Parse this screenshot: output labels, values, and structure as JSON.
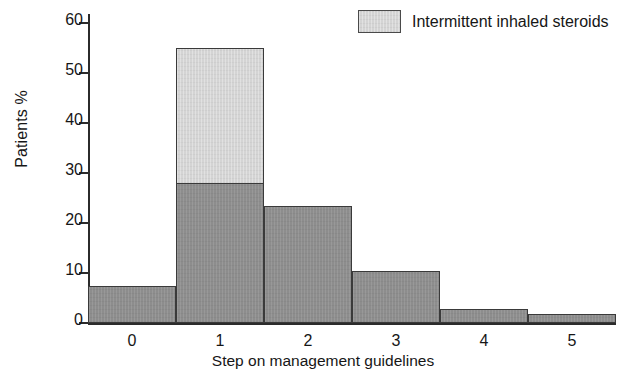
{
  "chart_data": {
    "type": "bar",
    "title": "",
    "subtitle": "",
    "xlabel": "Step on management guidelines",
    "ylabel": "Patients %",
    "categories": [
      "0",
      "1",
      "2",
      "3",
      "4",
      "5"
    ],
    "ylim": [
      0,
      60
    ],
    "xlim": [
      -0.5,
      5.5
    ],
    "yticks": [
      0,
      10,
      20,
      30,
      40,
      50,
      60
    ],
    "ytick_labels": [
      "0",
      "10",
      "20",
      "30",
      "40",
      "50",
      "60"
    ],
    "grid": false,
    "stacked": true,
    "bar_width": 1.0,
    "legend_position": "top-right",
    "series": [
      {
        "name": "Regular treatment",
        "color": "#8d8d8d",
        "in_legend": false,
        "values": [
          7.0,
          27.8,
          23.0,
          10.0,
          2.5,
          1.4
        ]
      },
      {
        "name": "Intermittent inhaled steroids",
        "color": "#d4d4d4",
        "in_legend": true,
        "values": [
          0,
          26.8,
          0,
          0,
          0,
          0
        ]
      }
    ],
    "totals": [
      7.0,
      54.6,
      23.0,
      10.0,
      2.5,
      1.4
    ]
  },
  "legend": {
    "entries": [
      {
        "label": "Intermittent inhaled steroids",
        "swatch_color": "#d4d4d4"
      }
    ]
  },
  "axes": {
    "y_label": "Patients %",
    "x_label": "Step on management guidelines"
  }
}
